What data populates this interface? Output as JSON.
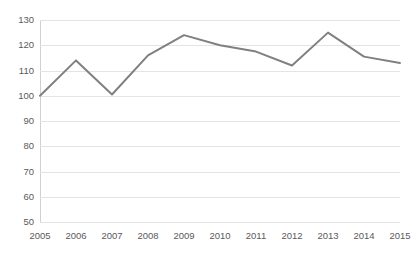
{
  "chart_data": {
    "type": "line",
    "title": "",
    "subtitle": "",
    "xlabel": "",
    "ylabel": "",
    "categories": [
      "2005",
      "2006",
      "2007",
      "2008",
      "2009",
      "2010",
      "2011",
      "2012",
      "2013",
      "2014",
      "2015"
    ],
    "values": [
      100,
      114,
      100.5,
      116,
      124,
      120,
      117.5,
      112,
      125,
      115.5,
      113
    ],
    "series": [
      {
        "name": "",
        "values": [
          100,
          114,
          100.5,
          116,
          124,
          120,
          117.5,
          112,
          125,
          115.5,
          113
        ],
        "color": "#808080"
      }
    ],
    "ylim": [
      50,
      130
    ],
    "ytick_step": 10,
    "yticks": [
      130,
      120,
      110,
      100,
      90,
      80,
      70,
      60,
      50
    ],
    "xticks": [
      "2005",
      "2006",
      "2007",
      "2008",
      "2009",
      "2010",
      "2011",
      "2012",
      "2013",
      "2014",
      "2015"
    ],
    "grid": true,
    "grid_axis": "y",
    "grid_color": "#e4e4e4",
    "legend": false,
    "legend_position": "none",
    "markers": false,
    "annotations": []
  },
  "style": {
    "background": "#ffffff",
    "line_color": "#808080",
    "tick_label_color": "#5a5a5a",
    "axis_color": "#d0d0d0"
  }
}
